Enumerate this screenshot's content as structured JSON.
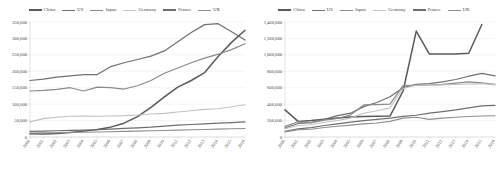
{
  "figure": {
    "panels": [
      "left",
      "right"
    ]
  },
  "legend": {
    "items": [
      {
        "label": "China",
        "color": "#5a5a5a",
        "width": 1.5
      },
      {
        "label": "US",
        "color": "#707070",
        "width": 1.2
      },
      {
        "label": "Japan",
        "color": "#8a8a8a",
        "width": 1.2
      },
      {
        "label": "Germany",
        "color": "#c2c2c2",
        "width": 1.1
      },
      {
        "label": "France",
        "color": "#6e6e6e",
        "width": 1.2
      },
      {
        "label": "UK",
        "color": "#8f8f8f",
        "width": 1.1
      }
    ]
  },
  "chart_data": [
    {
      "type": "line",
      "title": "",
      "xlabel": "",
      "ylabel": "",
      "grid": true,
      "legend_position": "top",
      "x": [
        "2000",
        "2001",
        "2002",
        "2003",
        "2004",
        "2005",
        "2006",
        "2007",
        "2008",
        "2009",
        "2010",
        "2011",
        "2012",
        "2013",
        "2014",
        "2015",
        "2016"
      ],
      "ylim": [
        0,
        350000
      ],
      "yticks": [
        0,
        50000,
        100000,
        150000,
        200000,
        250000,
        300000,
        350000
      ],
      "ytick_labels": [
        "0",
        "50,000",
        "100,000",
        "150,000",
        "200,000",
        "250,000",
        "300,000",
        "350,000"
      ],
      "series": [
        {
          "name": "China",
          "values": [
            10000,
            9000,
            11000,
            14000,
            18000,
            23000,
            30000,
            42000,
            62000,
            90000,
            122000,
            152000,
            172000,
            196000,
            245000,
            288000,
            325000
          ]
        },
        {
          "name": "US",
          "values": [
            172000,
            176000,
            182000,
            186000,
            190000,
            190000,
            214000,
            226000,
            236000,
            246000,
            262000,
            290000,
            318000,
            342000,
            345000,
            320000,
            295000
          ]
        },
        {
          "name": "Japan",
          "values": [
            140000,
            142000,
            145000,
            150000,
            140000,
            152000,
            150000,
            146000,
            156000,
            172000,
            194000,
            210000,
            226000,
            240000,
            252000,
            266000,
            284000
          ]
        },
        {
          "name": "Germany",
          "values": [
            46000,
            56000,
            60000,
            63000,
            64000,
            63000,
            64000,
            65000,
            67000,
            70000,
            72000,
            76000,
            80000,
            84000,
            86000,
            92000,
            98000
          ]
        },
        {
          "name": "France",
          "values": [
            17000,
            18000,
            19000,
            20000,
            21000,
            22000,
            24000,
            26000,
            28000,
            30000,
            33000,
            36000,
            38000,
            40000,
            42000,
            44000,
            46000
          ]
        },
        {
          "name": "UK",
          "values": [
            12000,
            12500,
            13000,
            14000,
            14500,
            15000,
            16000,
            17000,
            18000,
            19000,
            20000,
            21000,
            22000,
            23000,
            24000,
            25000,
            26000
          ]
        }
      ]
    },
    {
      "type": "line",
      "title": "",
      "xlabel": "",
      "ylabel": "",
      "grid": true,
      "legend_position": "top",
      "x": [
        "2000",
        "2001",
        "2002",
        "2003",
        "2004",
        "2005",
        "2006",
        "2007",
        "2008",
        "2009",
        "2010",
        "2011",
        "2012",
        "2013",
        "2014",
        "2015",
        "2016"
      ],
      "ylim": [
        0,
        1400000
      ],
      "yticks": [
        0,
        200000,
        400000,
        600000,
        800000,
        1000000,
        1200000,
        1400000
      ],
      "ytick_labels": [
        "0",
        "200,000",
        "400,000",
        "600,000",
        "800,000",
        "1,000,000",
        "1,200,000",
        "1,400,000"
      ],
      "series": [
        {
          "name": "China",
          "values": [
            330000,
            190000,
            200000,
            215000,
            230000,
            245000,
            250000,
            252000,
            255000,
            560000,
            1290000,
            1010000,
            1010000,
            1010000,
            1020000,
            1370000,
            null
          ]
        },
        {
          "name": "US",
          "values": [
            110000,
            165000,
            175000,
            215000,
            260000,
            290000,
            370000,
            420000,
            490000,
            600000,
            640000,
            650000,
            670000,
            700000,
            740000,
            775000,
            745000
          ]
        },
        {
          "name": "Japan",
          "values": [
            130000,
            185000,
            175000,
            205000,
            225000,
            270000,
            390000,
            395000,
            400000,
            625000,
            630000,
            630000,
            640000,
            655000,
            670000,
            660000,
            640000
          ]
        },
        {
          "name": "Germany",
          "values": [
            100000,
            140000,
            150000,
            180000,
            200000,
            230000,
            290000,
            320000,
            355000,
            590000,
            630000,
            630000,
            635000,
            640000,
            645000,
            650000,
            635000
          ]
        },
        {
          "name": "France",
          "values": [
            70000,
            100000,
            115000,
            140000,
            160000,
            180000,
            200000,
            215000,
            230000,
            250000,
            265000,
            290000,
            310000,
            330000,
            355000,
            380000,
            385000
          ]
        },
        {
          "name": "UK",
          "values": [
            60000,
            90000,
            95000,
            115000,
            130000,
            145000,
            160000,
            170000,
            190000,
            230000,
            240000,
            215000,
            230000,
            240000,
            250000,
            255000,
            258000
          ]
        }
      ]
    }
  ]
}
